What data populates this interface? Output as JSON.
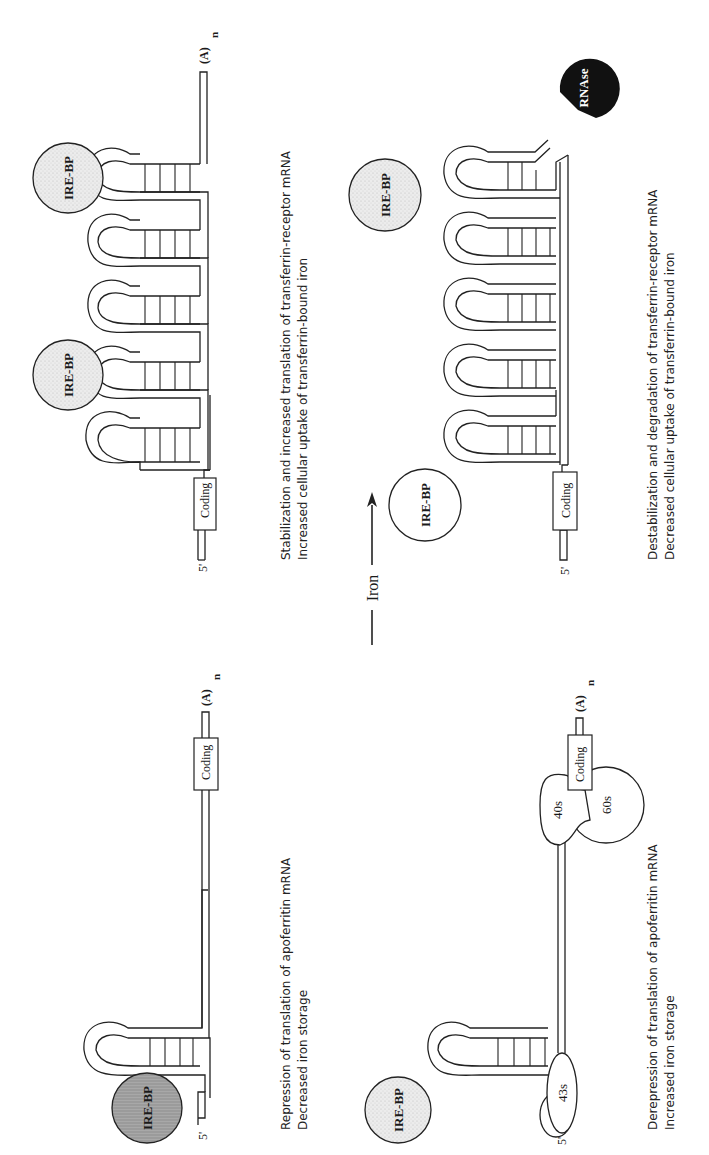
{
  "figure": {
    "orientation": "rotated-90-ccw",
    "arrow": {
      "label": "Iron",
      "direction": "left-panels-to-right-panels"
    },
    "panels": [
      {
        "id": "apoferritin-low-iron",
        "position": "top-left",
        "five_prime": "5'",
        "poly_a": "(A)",
        "poly_a_sub": "n",
        "coding_label": "Coding",
        "bound_protein": "IRE-BP",
        "caption_line1": "Repression of translation of apoferritin mRNA",
        "caption_line2": "Decreased iron storage"
      },
      {
        "id": "apoferritin-high-iron",
        "position": "top-right",
        "five_prime": "5'",
        "poly_a": "(A)",
        "poly_a_sub": "n",
        "coding_label": "Coding",
        "free_protein": "IRE-BP",
        "ribosome_43s": "43s",
        "ribosome_40s": "40s",
        "ribosome_60s": "60s",
        "caption_line1": "Derepression of translation of apoferritin mRNA",
        "caption_line2": "Increased iron storage"
      },
      {
        "id": "transferrin-receptor-low-iron",
        "position": "bottom-left",
        "five_prime": "5'",
        "poly_a": "(A)",
        "poly_a_sub": "n",
        "coding_label": "Coding",
        "bound_protein_1": "IRE-BP",
        "bound_protein_2": "IRE-BP",
        "caption_line1": "Stabilization and increased translation of transferrin-receptor mRNA",
        "caption_line2": "Increased cellular uptake of transferrin-bound iron"
      },
      {
        "id": "transferrin-receptor-high-iron",
        "position": "bottom-right",
        "five_prime": "5'",
        "coding_label": "Coding",
        "free_protein_1": "IRE-BP",
        "free_protein_2": "IRE-BP",
        "enzyme": "RNAse",
        "caption_line1": "Destabilization and degradation of transferrin-receptor mRNA",
        "caption_line2": "Decreased cellular uptake of transferrin-bound iron"
      }
    ],
    "colors": {
      "ink": "#222222",
      "bound_ire_bp_fill": "#9a9a9a",
      "ire_bp_light_fill": "#e4e4e4",
      "rnase_fill": "#111111",
      "background": "#ffffff"
    }
  }
}
